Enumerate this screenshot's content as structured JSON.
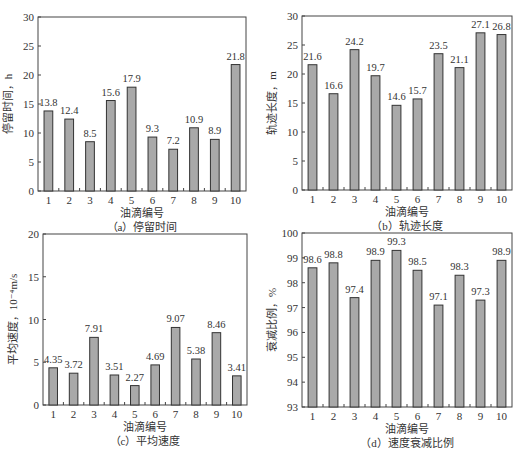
{
  "figure": {
    "colors": {
      "bar_fill": "#a9a9a9",
      "bar_stroke": "#333333",
      "axis": "#444444",
      "text": "#333333"
    }
  },
  "chart_data": [
    {
      "id": "a",
      "type": "bar",
      "title": "（a）停留时间",
      "xlabel": "油滴编号",
      "ylabel": "停留时间，h",
      "categories": [
        "1",
        "2",
        "3",
        "4",
        "5",
        "6",
        "7",
        "8",
        "9",
        "10"
      ],
      "values": [
        13.8,
        12.4,
        8.5,
        15.6,
        17.9,
        9.3,
        7.2,
        10.9,
        8.9,
        21.8
      ],
      "labels": [
        "13.8",
        "12.4",
        "8.5",
        "15.6",
        "17.9",
        "9.3",
        "7.2",
        "10.9",
        "8.9",
        "21.8"
      ],
      "ylim": [
        0,
        30
      ],
      "yticks": [
        0,
        5,
        10,
        15,
        20,
        25,
        30
      ],
      "grid": false,
      "box": {
        "left": 38,
        "top": 17,
        "right": 246,
        "bottom": 191
      }
    },
    {
      "id": "b",
      "type": "bar",
      "title": "（b）轨迹长度",
      "xlabel": "油滴编号",
      "ylabel": "轨迹长度，m",
      "categories": [
        "1",
        "2",
        "3",
        "4",
        "5",
        "6",
        "7",
        "8",
        "9",
        "10"
      ],
      "values": [
        21.6,
        16.6,
        24.2,
        19.7,
        14.6,
        15.7,
        23.5,
        21.1,
        27.1,
        26.8
      ],
      "labels": [
        "21.6",
        "16.6",
        "24.2",
        "19.7",
        "14.6",
        "15.7",
        "23.5",
        "21.1",
        "27.1",
        "26.8"
      ],
      "ylim": [
        0,
        30
      ],
      "yticks": [
        0,
        5,
        10,
        15,
        20,
        25,
        30
      ],
      "grid": false,
      "box": {
        "left": 302,
        "top": 16,
        "right": 512,
        "bottom": 190
      }
    },
    {
      "id": "c",
      "type": "bar",
      "title": "（c）平均速度",
      "xlabel": "油滴编号",
      "ylabel": "平均速度，10⁻⁴m/s",
      "categories": [
        "1",
        "2",
        "3",
        "4",
        "5",
        "6",
        "7",
        "8",
        "9",
        "10"
      ],
      "values": [
        4.35,
        3.72,
        7.91,
        3.51,
        2.27,
        4.69,
        9.07,
        5.38,
        8.46,
        3.41
      ],
      "labels": [
        "4.35",
        "3.72",
        "7.91",
        "3.51",
        "2.27",
        "4.69",
        "9.07",
        "5.38",
        "8.46",
        "3.41"
      ],
      "ylim": [
        0,
        20
      ],
      "yticks": [
        0,
        5,
        10,
        15,
        20
      ],
      "grid": false,
      "box": {
        "left": 43,
        "top": 234,
        "right": 247,
        "bottom": 405
      }
    },
    {
      "id": "d",
      "type": "bar",
      "title": "（d）速度衰减比例",
      "xlabel": "油滴编号",
      "ylabel": "衰减比例，%",
      "categories": [
        "1",
        "2",
        "3",
        "4",
        "5",
        "6",
        "7",
        "8",
        "9",
        "10"
      ],
      "values": [
        98.6,
        98.8,
        97.4,
        98.9,
        99.3,
        98.5,
        97.1,
        98.3,
        97.3,
        98.9
      ],
      "labels": [
        "98.6",
        "98.8",
        "97.4",
        "98.9",
        "99.3",
        "98.5",
        "97.1",
        "98.3",
        "97.3",
        "98.9"
      ],
      "ylim": [
        93,
        100
      ],
      "yticks": [
        93,
        94,
        95,
        96,
        97,
        98,
        99,
        100
      ],
      "grid": false,
      "box": {
        "left": 302,
        "top": 233,
        "right": 512,
        "bottom": 407
      }
    }
  ]
}
